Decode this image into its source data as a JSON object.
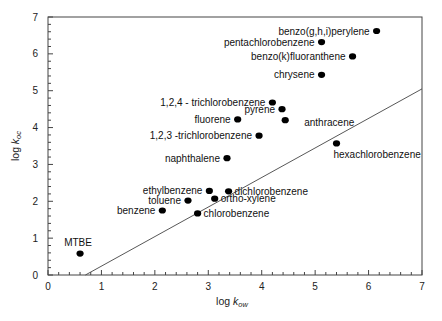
{
  "chart_data": {
    "type": "scatter",
    "title": "",
    "xlabel": "log k_ow",
    "ylabel": "log k_oc",
    "xlabel_main": "log ",
    "xlabel_k": "k",
    "xlabel_sub": "ow",
    "ylabel_main": "log ",
    "ylabel_k": "k",
    "ylabel_sub": "oc",
    "xlim": [
      0,
      7
    ],
    "ylim": [
      0,
      7
    ],
    "x_ticks": [
      "0",
      "1",
      "2",
      "3",
      "4",
      "5",
      "6",
      "7"
    ],
    "y_ticks": [
      "0",
      "1",
      "2",
      "3",
      "4",
      "5",
      "6",
      "7"
    ],
    "grid": false,
    "legend": "none",
    "points": [
      {
        "name": "benzo(g,h,i)perylene",
        "x": 6.15,
        "y": 6.62,
        "label_pos": "left"
      },
      {
        "name": "pentachlorobenzene",
        "x": 5.12,
        "y": 6.32,
        "label_pos": "left"
      },
      {
        "name": "benzo(k)fluoranthene",
        "x": 5.7,
        "y": 5.93,
        "label_pos": "left"
      },
      {
        "name": "chrysene",
        "x": 5.12,
        "y": 5.43,
        "label_pos": "left"
      },
      {
        "name": "1,2,4 - trichlorobenzene",
        "x": 4.2,
        "y": 4.68,
        "label_pos": "left"
      },
      {
        "name": "pyrene",
        "x": 4.38,
        "y": 4.5,
        "label_pos": "left"
      },
      {
        "name": "fluorene",
        "x": 3.55,
        "y": 4.22,
        "label_pos": "left"
      },
      {
        "name": "anthracene",
        "x": 4.44,
        "y": 4.2,
        "label_pos": "right-below"
      },
      {
        "name": "1,2,3 -trichlorobenzene",
        "x": 3.95,
        "y": 3.78,
        "label_pos": "left"
      },
      {
        "name": "hexachlorobenzene",
        "x": 5.4,
        "y": 3.57,
        "label_pos": "below"
      },
      {
        "name": "naphthalene",
        "x": 3.35,
        "y": 3.17,
        "label_pos": "left"
      },
      {
        "name": "ethylbenzene",
        "x": 3.02,
        "y": 2.28,
        "label_pos": "left"
      },
      {
        "name": "dichlorobenzene",
        "x": 3.38,
        "y": 2.27,
        "label_pos": "right"
      },
      {
        "name": "ortho-xylene",
        "x": 3.12,
        "y": 2.07,
        "label_pos": "right"
      },
      {
        "name": "toluene",
        "x": 2.62,
        "y": 2.02,
        "label_pos": "left"
      },
      {
        "name": "benzene",
        "x": 2.14,
        "y": 1.75,
        "label_pos": "left"
      },
      {
        "name": "chlorobenzene",
        "x": 2.8,
        "y": 1.67,
        "label_pos": "right"
      },
      {
        "name": "MTBE",
        "x": 0.6,
        "y": 0.58,
        "label_pos": "above"
      }
    ],
    "regression_line": {
      "x1": 0.7,
      "y1": 0,
      "x2": 7.0,
      "y2": 5.05
    }
  }
}
